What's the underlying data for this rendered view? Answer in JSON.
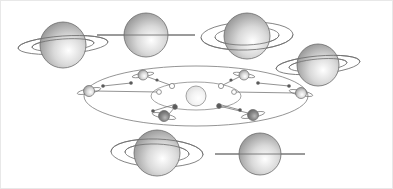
{
  "figure": {
    "background_color": "#ffffff",
    "border_color": "#e8e8e8",
    "width": 393,
    "height": 189
  },
  "palette": {
    "outline": "#6b6b6b",
    "outline_light": "#8d8d8d",
    "orbit_line": "#7a7a7a",
    "sightline": "#6f6f6f",
    "ring_line": "#707070",
    "planet_light": "#ffffff",
    "planet_mid": "#d9d9d9",
    "planet_dark": "#8f8f8f",
    "planet_shadow": "#5f5f5f",
    "sun_fill": "#f2f2f2",
    "sun_edge": "#9a9a9a",
    "dot_open": "#ffffff",
    "dot_filled": "#5a5a5a"
  },
  "large_saturns": [
    {
      "id": "saturn-left-open-rings",
      "label": "Saturn with rings open, viewed from above ring plane",
      "cx": 63,
      "cy": 45,
      "r": 23,
      "ring_rx": 45,
      "ring_ry": 9,
      "ring_rx_inner": 31,
      "ring_ry_inner": 6,
      "ring_tilt_deg": -4,
      "aspect": "rings-open-north",
      "ring_style": "ellipse",
      "planet_in_front": true
    },
    {
      "id": "saturn-top-edge-on",
      "label": "Saturn with rings edge-on",
      "cx": 146,
      "cy": 35,
      "r": 22,
      "ring_rx": 49,
      "ring_ry": 0,
      "ring_rx_inner": 0,
      "ring_ry_inner": 0,
      "ring_tilt_deg": 0,
      "aspect": "rings-edge-on",
      "ring_style": "line",
      "planet_in_front": true
    },
    {
      "id": "saturn-top-right-open-rings",
      "label": "Saturn with rings wide open, planet behind rings",
      "cx": 247,
      "cy": 36,
      "r": 23,
      "ring_rx": 46,
      "ring_ry": 14,
      "ring_rx_inner": 32,
      "ring_ry_inner": 9,
      "ring_tilt_deg": -2,
      "aspect": "rings-open-south",
      "ring_style": "ellipse",
      "planet_in_front": false
    },
    {
      "id": "saturn-right-open-rings",
      "label": "Saturn with rings partly open",
      "cx": 318,
      "cy": 65,
      "r": 21,
      "ring_rx": 42,
      "ring_ry": 9,
      "ring_rx_inner": 29,
      "ring_ry_inner": 6,
      "ring_tilt_deg": -5,
      "aspect": "rings-opening",
      "ring_style": "ellipse",
      "planet_in_front": true
    },
    {
      "id": "saturn-bottom-open-rings",
      "label": "Saturn with rings wide open, planet in front of rings",
      "cx": 157,
      "cy": 153,
      "r": 23,
      "ring_rx": 46,
      "ring_ry": 14,
      "ring_rx_inner": 32,
      "ring_ry_inner": 9,
      "ring_tilt_deg": 2,
      "aspect": "rings-open-north-max",
      "ring_style": "ellipse",
      "planet_in_front": true
    },
    {
      "id": "saturn-bottom-right-edge-on",
      "label": "Saturn with rings edge-on",
      "cx": 260,
      "cy": 154,
      "r": 21,
      "ring_rx": 45,
      "ring_ry": 0,
      "ring_rx_inner": 0,
      "ring_ry_inner": 0,
      "ring_tilt_deg": 0,
      "aspect": "rings-edge-on",
      "ring_style": "line",
      "planet_in_front": true
    }
  ],
  "orbit_diagram": {
    "id": "saturn-orbit-diagram",
    "label": "Saturn orbit around the Sun with Earth viewing geometry",
    "outer_orbit": {
      "cx": 196,
      "cy": 96,
      "rx": 112,
      "ry": 30,
      "name": "saturn-orbit"
    },
    "inner_orbit": {
      "cx": 196,
      "cy": 96,
      "rx": 45,
      "ry": 14,
      "name": "earth-orbit"
    },
    "sun": {
      "cx": 196,
      "cy": 96,
      "r": 10,
      "name": "sun"
    },
    "orbit_saturns": [
      {
        "id": "orbit-saturn-1",
        "cx": 89,
        "cy": 91,
        "r": 5.5,
        "ring_rx": 12,
        "ring_ry": 2.5,
        "tilt": -12,
        "shade": "light"
      },
      {
        "id": "orbit-saturn-2",
        "cx": 143,
        "cy": 75,
        "r": 5,
        "ring_rx": 11,
        "ring_ry": 2.0,
        "tilt": -10,
        "shade": "light"
      },
      {
        "id": "orbit-saturn-3",
        "cx": 244,
        "cy": 75,
        "r": 5,
        "ring_rx": 11,
        "ring_ry": 2.0,
        "tilt": 10,
        "shade": "light"
      },
      {
        "id": "orbit-saturn-4",
        "cx": 301,
        "cy": 93,
        "r": 5.5,
        "ring_rx": 12,
        "ring_ry": 2.5,
        "tilt": 12,
        "shade": "light"
      },
      {
        "id": "orbit-saturn-5",
        "cx": 253,
        "cy": 115,
        "r": 5.5,
        "ring_rx": 12,
        "ring_ry": 2.5,
        "tilt": -12,
        "shade": "dark"
      },
      {
        "id": "orbit-saturn-6",
        "cx": 164,
        "cy": 116,
        "r": 5.5,
        "ring_rx": 12,
        "ring_ry": 2.5,
        "tilt": 12,
        "shade": "dark"
      }
    ],
    "earth_markers": [
      {
        "id": "earth-marker-1",
        "cx": 172,
        "cy": 86,
        "r": 2.6,
        "fill": "open"
      },
      {
        "id": "earth-marker-2",
        "cx": 221,
        "cy": 86,
        "r": 2.6,
        "fill": "open"
      },
      {
        "id": "earth-marker-3",
        "cx": 159,
        "cy": 92,
        "r": 2.4,
        "fill": "open"
      },
      {
        "id": "earth-marker-4",
        "cx": 234,
        "cy": 92,
        "r": 2.4,
        "fill": "open"
      },
      {
        "id": "earth-marker-5",
        "cx": 175,
        "cy": 107,
        "r": 2.4,
        "fill": "filled"
      },
      {
        "id": "earth-marker-6",
        "cx": 219,
        "cy": 106,
        "r": 2.4,
        "fill": "filled"
      }
    ],
    "sight_lines": [
      {
        "id": "sightline-1",
        "x1": 94,
        "y1": 91,
        "x2": 159,
        "y2": 92
      },
      {
        "id": "sightline-2",
        "x1": 148,
        "y1": 77,
        "x2": 173,
        "y2": 86
      },
      {
        "id": "sightline-3",
        "x1": 239,
        "y1": 77,
        "x2": 221,
        "y2": 86
      },
      {
        "id": "sightline-4",
        "x1": 296,
        "y1": 93,
        "x2": 234,
        "y2": 92
      },
      {
        "id": "sightline-5",
        "x1": 248,
        "y1": 113,
        "x2": 219,
        "y2": 106
      },
      {
        "id": "sightline-6",
        "x1": 169,
        "y1": 114,
        "x2": 175,
        "y2": 107
      },
      {
        "id": "sightline-7",
        "x1": 103,
        "y1": 86,
        "x2": 131,
        "y2": 83
      },
      {
        "id": "sightline-8",
        "x1": 289,
        "y1": 86,
        "x2": 258,
        "y2": 83
      },
      {
        "id": "sightline-9",
        "x1": 153,
        "y1": 111,
        "x2": 176,
        "y2": 104
      },
      {
        "id": "sightline-10",
        "x1": 240,
        "y1": 110,
        "x2": 218,
        "y2": 104
      }
    ],
    "line_end_dots": [
      {
        "id": "line-dot-1",
        "cx": 103,
        "cy": 86,
        "r": 1.8
      },
      {
        "id": "line-dot-2",
        "cx": 131,
        "cy": 83,
        "r": 1.8
      },
      {
        "id": "line-dot-3",
        "cx": 289,
        "cy": 86,
        "r": 1.8
      },
      {
        "id": "line-dot-4",
        "cx": 258,
        "cy": 83,
        "r": 1.8
      },
      {
        "id": "line-dot-5",
        "cx": 153,
        "cy": 111,
        "r": 1.8
      },
      {
        "id": "line-dot-6",
        "cx": 240,
        "cy": 110,
        "r": 1.8
      },
      {
        "id": "line-dot-7",
        "cx": 157,
        "cy": 80,
        "r": 1.6
      },
      {
        "id": "line-dot-8",
        "cx": 231,
        "cy": 80,
        "r": 1.6
      }
    ]
  }
}
